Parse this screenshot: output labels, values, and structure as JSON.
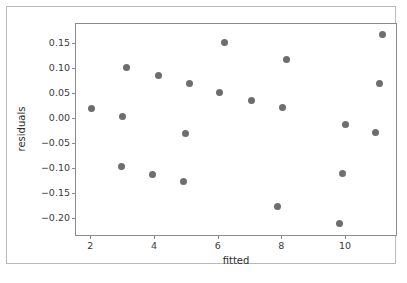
{
  "figure": {
    "background_color": "#ffffff",
    "frame_color": "#b9b9b9",
    "axes_color": "#8a8a8a"
  },
  "chart_data": {
    "type": "scatter",
    "title": "",
    "xlabel": "fitted",
    "ylabel": "residuals",
    "grid": false,
    "legend": null,
    "marker_color": "#6e6e6e",
    "marker_size_px": 7,
    "xlim": [
      1.55,
      11.6
    ],
    "ylim": [
      -0.235,
      0.187
    ],
    "xticks": [
      2,
      4,
      6,
      8,
      10
    ],
    "xtick_labels": [
      "2",
      "4",
      "6",
      "8",
      "10"
    ],
    "yticks": [
      0.15,
      0.1,
      0.05,
      0.0,
      -0.05,
      -0.1,
      -0.15,
      -0.2
    ],
    "ytick_labels": [
      "0.15",
      "0.10",
      "0.05",
      "0.00",
      "−0.05",
      "−0.10",
      "−0.15",
      "−0.20"
    ],
    "x": [
      2.04,
      3.02,
      3.14,
      4.13,
      4.98,
      5.13,
      6.07,
      6.21,
      7.06,
      7.87,
      8.05,
      8.16,
      9.82,
      9.93,
      10.02,
      10.97,
      11.08,
      11.18,
      2.97,
      4.92
    ],
    "y": [
      0.018,
      0.002,
      0.101,
      0.084,
      -0.031,
      0.068,
      0.051,
      0.151,
      0.035,
      -0.178,
      0.02,
      0.117,
      -0.211,
      -0.112,
      -0.014,
      -0.03,
      0.068,
      0.167,
      -0.097,
      -0.128
    ],
    "points": [
      {
        "x": 2.04,
        "y": 0.018
      },
      {
        "x": 2.97,
        "y": -0.097
      },
      {
        "x": 3.02,
        "y": 0.002
      },
      {
        "x": 3.14,
        "y": 0.101
      },
      {
        "x": 3.94,
        "y": -0.113
      },
      {
        "x": 4.13,
        "y": 0.084
      },
      {
        "x": 4.92,
        "y": -0.128
      },
      {
        "x": 4.98,
        "y": -0.031
      },
      {
        "x": 5.13,
        "y": 0.068
      },
      {
        "x": 6.07,
        "y": 0.051
      },
      {
        "x": 6.21,
        "y": 0.151
      },
      {
        "x": 7.06,
        "y": 0.035
      },
      {
        "x": 7.87,
        "y": -0.178
      },
      {
        "x": 8.05,
        "y": 0.02
      },
      {
        "x": 8.16,
        "y": 0.117
      },
      {
        "x": 9.82,
        "y": -0.211
      },
      {
        "x": 9.93,
        "y": -0.112
      },
      {
        "x": 10.02,
        "y": -0.014
      },
      {
        "x": 10.97,
        "y": -0.03
      },
      {
        "x": 11.08,
        "y": 0.068
      },
      {
        "x": 11.18,
        "y": 0.167
      }
    ]
  }
}
